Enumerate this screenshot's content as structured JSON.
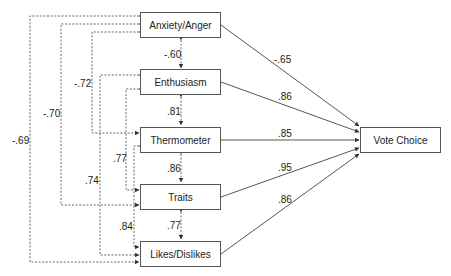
{
  "nodes": {
    "anxiety": "Anxiety/Anger",
    "enthusiasm": "Enthusiasm",
    "thermometer": "Thermometer",
    "traits": "Traits",
    "likes": "Likes/Dislikes",
    "vote": "Vote Choice"
  },
  "paths_to_vote": {
    "anxiety": "-.65",
    "enthusiasm": ".86",
    "thermometer": ".85",
    "traits": ".95",
    "likes": ".86"
  },
  "correlations": {
    "anxiety_enthusiasm": "-.60",
    "enthusiasm_thermometer": ".81",
    "thermometer_traits": ".86",
    "traits_likes": ".77",
    "anxiety_thermometer": "-.72",
    "anxiety_traits": "-.70",
    "anxiety_likes": "-.69",
    "enthusiasm_traits": ".77",
    "enthusiasm_likes": ".74",
    "thermometer_likes": ".84"
  }
}
